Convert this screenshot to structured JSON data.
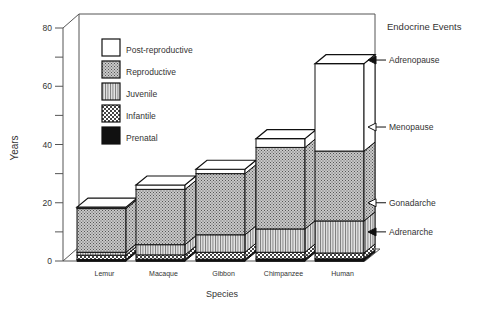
{
  "chart_data": {
    "type": "bar",
    "subtype": "stacked-3d",
    "title": "",
    "xlabel": "Species",
    "ylabel": "Years",
    "ylim": [
      0,
      80
    ],
    "yticks": [
      0,
      20,
      40,
      60,
      80
    ],
    "grid": false,
    "legend_position": "upper-left inside",
    "categories": [
      "Lemur",
      "Macaque",
      "Gibbon",
      "Chimpanzee",
      "Human"
    ],
    "series": [
      {
        "name": "Prenatal",
        "pattern": "solid-black",
        "values": [
          0.5,
          0.6,
          0.6,
          0.7,
          0.75
        ]
      },
      {
        "name": "Infantile",
        "pattern": "checker",
        "values": [
          1.5,
          1.5,
          2.4,
          2.3,
          2.0
        ]
      },
      {
        "name": "Juvenile",
        "pattern": "vertical-lines",
        "values": [
          1.0,
          3.5,
          6.0,
          8.0,
          11.0
        ]
      },
      {
        "name": "Reproductive",
        "pattern": "fine-dots",
        "values": [
          15.0,
          19.0,
          21.0,
          28.0,
          24.0
        ]
      },
      {
        "name": "Post-reproductive",
        "pattern": "white",
        "values": [
          0.5,
          1.5,
          1.5,
          3.0,
          30.0
        ]
      }
    ],
    "stack_tops": [
      18.5,
      26,
      31.5,
      42,
      72
    ],
    "annotations": {
      "title": "Endocrine Events",
      "events": [
        {
          "label": "Adrenopause",
          "marker": "filled-arrow",
          "y": 69
        },
        {
          "label": "Menopause",
          "marker": "open-arrow",
          "y": 46
        },
        {
          "label": "Gonadarche",
          "marker": "open-arrow",
          "y": 20
        },
        {
          "label": "Adrenarche",
          "marker": "filled-arrow",
          "y": 10
        }
      ]
    }
  },
  "legend": [
    {
      "label": "Post-reproductive",
      "pattern": "white"
    },
    {
      "label": "Reproductive",
      "pattern": "fine-dots"
    },
    {
      "label": "Juvenile",
      "pattern": "vertical-lines"
    },
    {
      "label": "Infantile",
      "pattern": "checker"
    },
    {
      "label": "Prenatal",
      "pattern": "solid-black"
    }
  ],
  "axis": {
    "xlabel": "Species",
    "ylabel": "Years",
    "ticks": [
      "0",
      "20",
      "40",
      "60",
      "80"
    ]
  },
  "events_title": "Endocrine Events",
  "events": [
    "Adrenopause",
    "Menopause",
    "Gonadarche",
    "Adrenarche"
  ],
  "categories": [
    "Lemur",
    "Macaque",
    "Gibbon",
    "Chimpanzee",
    "Human"
  ]
}
